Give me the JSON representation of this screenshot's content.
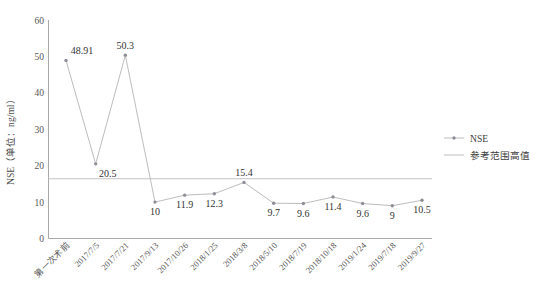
{
  "chart_data": {
    "type": "line",
    "title": "",
    "xlabel": "",
    "ylabel": "NSE（单位：ng/ml）",
    "ylim": [
      0,
      60
    ],
    "yticks": [
      0,
      10,
      20,
      30,
      40,
      50,
      60
    ],
    "grid": false,
    "legend_position": "right",
    "categories": [
      "第一次术前",
      "2017/7/5",
      "2017/7/21",
      "2017/9/13",
      "2017/10/26",
      "2018/1/25",
      "2018/3/8",
      "2018/5/10",
      "2018/7/19",
      "2018/10/18",
      "2019/1/24",
      "2019/7/18",
      "2019/9/27"
    ],
    "series": [
      {
        "name": "NSE",
        "values": [
          48.91,
          20.5,
          50.3,
          10,
          11.9,
          12.3,
          15.4,
          9.7,
          9.6,
          11.4,
          9.6,
          9,
          10.5
        ],
        "data_labels": [
          "48.91",
          "20.5",
          "50.3",
          "10",
          "11.9",
          "12.3",
          "15.4",
          "9.7",
          "9.6",
          "11.4",
          "9.6",
          "9",
          "10.5"
        ],
        "color": "#b4b4b4",
        "marker_color": "#8d8d97"
      },
      {
        "name": "参考范围高值",
        "type": "reference-line",
        "value": 16.3,
        "color": "#c3c3c3"
      }
    ]
  },
  "legend": {
    "items": [
      {
        "label": "NSE",
        "marker": "line-with-point",
        "color": "#8d8d97"
      },
      {
        "label": "参考范围高值",
        "marker": "line",
        "color": "#c3c3c3"
      }
    ]
  },
  "axis": {
    "y_title": "NSE（单位：ng/ml）",
    "y_tick_labels": [
      "60",
      "50",
      "40",
      "30",
      "20",
      "10",
      "0"
    ]
  }
}
